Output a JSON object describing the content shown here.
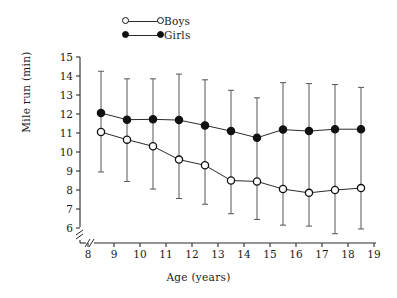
{
  "chart_data": {
    "type": "line",
    "title": "",
    "xlabel": "Age (years)",
    "ylabel": "Mile run (min)",
    "xlim": [
      7.6,
      19.0
    ],
    "ylim": [
      5.55,
      15.0
    ],
    "xticks": [
      8,
      9,
      10,
      11,
      12,
      13,
      14,
      15,
      16,
      17,
      18,
      19
    ],
    "yticks": [
      6,
      7,
      8,
      9,
      10,
      11,
      12,
      13,
      14,
      15
    ],
    "grid": false,
    "legend_position": "top-center",
    "x_axis_break": true,
    "y_axis_break": true,
    "x": [
      8.5,
      9.5,
      10.5,
      11.5,
      12.5,
      13.5,
      14.5,
      15.5,
      16.5,
      17.5,
      18.5
    ],
    "series": [
      {
        "name": "Boys",
        "marker": "open-circle",
        "values": [
          11.05,
          10.65,
          10.3,
          9.6,
          9.3,
          8.5,
          8.45,
          8.05,
          7.85,
          8.0,
          8.1
        ],
        "error_low": [
          8.95,
          8.45,
          8.05,
          7.55,
          7.25,
          6.75,
          6.45,
          6.15,
          6.1,
          5.7,
          5.95
        ]
      },
      {
        "name": "Girls",
        "marker": "filled-circle",
        "values": [
          12.05,
          11.7,
          11.72,
          11.68,
          11.4,
          11.1,
          10.75,
          11.18,
          11.1,
          11.2,
          11.2
        ],
        "error_high": [
          14.25,
          13.85,
          13.85,
          14.1,
          13.8,
          13.25,
          12.85,
          13.65,
          13.6,
          13.55,
          13.4
        ]
      }
    ]
  },
  "legend": {
    "items": [
      {
        "label": "Boys",
        "marker": "open-circle"
      },
      {
        "label": "Girls",
        "marker": "filled-circle"
      }
    ]
  },
  "axes": {
    "x_label": "Age (years)",
    "y_label": "Mile run (min)",
    "x_tick_labels": [
      "8",
      "9",
      "10",
      "11",
      "12",
      "13",
      "14",
      "15",
      "16",
      "17",
      "18",
      "19"
    ],
    "y_tick_labels": [
      "15",
      "14",
      "13",
      "12",
      "11",
      "10",
      "9",
      "8",
      "7",
      "6"
    ]
  },
  "colors": {
    "axis": "#2b2b2b",
    "marker_fill_girls": "#111111",
    "marker_fill_boys": "#ffffff",
    "marker_edge": "#111111",
    "line": "#2b2b2b",
    "errorbar": "#555555",
    "background": "#ffffff"
  }
}
